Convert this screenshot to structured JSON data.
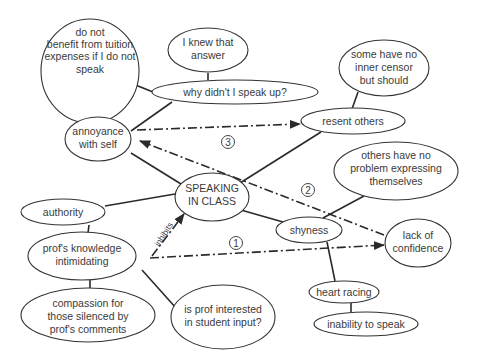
{
  "diagram": {
    "type": "concept-map",
    "central_node": "SPEAKING IN CLASS",
    "nodes": [
      {
        "id": "tuition",
        "lines": [
          "do not",
          "benefit from tuition",
          "expenses if I do not",
          "speak"
        ]
      },
      {
        "id": "knew",
        "lines": [
          "I knew that",
          "answer"
        ]
      },
      {
        "id": "why",
        "lines": [
          "why didn't I speak up?"
        ]
      },
      {
        "id": "censor",
        "lines": [
          "some have no",
          "inner censor",
          "but should"
        ]
      },
      {
        "id": "resent",
        "lines": [
          "resent others"
        ]
      },
      {
        "id": "annoyance",
        "lines": [
          "annoyance",
          "with self"
        ]
      },
      {
        "id": "others",
        "lines": [
          "others have no",
          "problem expressing",
          "themselves"
        ]
      },
      {
        "id": "speaking",
        "lines": [
          "SPEAKING",
          "IN CLASS"
        ]
      },
      {
        "id": "authority",
        "lines": [
          "authority"
        ]
      },
      {
        "id": "shyness",
        "lines": [
          "shyness"
        ]
      },
      {
        "id": "confidence",
        "lines": [
          "lack of",
          "confidence"
        ]
      },
      {
        "id": "prof",
        "lines": [
          "prof's knowledge",
          "intimidating"
        ]
      },
      {
        "id": "heart",
        "lines": [
          "heart racing"
        ]
      },
      {
        "id": "compassion",
        "lines": [
          "compassion for",
          "those silenced by",
          "prof's comments"
        ]
      },
      {
        "id": "interested",
        "lines": [
          "is prof interested",
          "in student input?"
        ]
      },
      {
        "id": "inability",
        "lines": [
          "inability to speak"
        ]
      }
    ],
    "edge_labels": {
      "inhibits": "inhibits"
    },
    "markers": {
      "one": "1",
      "two": "2",
      "three": "3"
    }
  }
}
